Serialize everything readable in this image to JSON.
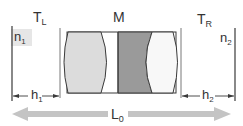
{
  "diagram": {
    "labels": {
      "left_medium": "T",
      "left_medium_sub": "L",
      "middle": "M",
      "right_medium": "T",
      "right_medium_sub": "R",
      "n1": "n",
      "n1_sub": "1",
      "n2": "n",
      "n2_sub": "2",
      "h1": "h",
      "h1_sub": "1",
      "h2": "h",
      "h2_sub": "2",
      "L0": "L",
      "L0_sub": "0"
    },
    "colors": {
      "line": "#3a3a3a",
      "lens_light": "#dcdcdc",
      "lens_dark": "#9a9a9a",
      "lens_white": "#ffffff",
      "n_box": "#e6e6e6",
      "arrow": "#c4c4c4",
      "text": "#333333"
    }
  }
}
